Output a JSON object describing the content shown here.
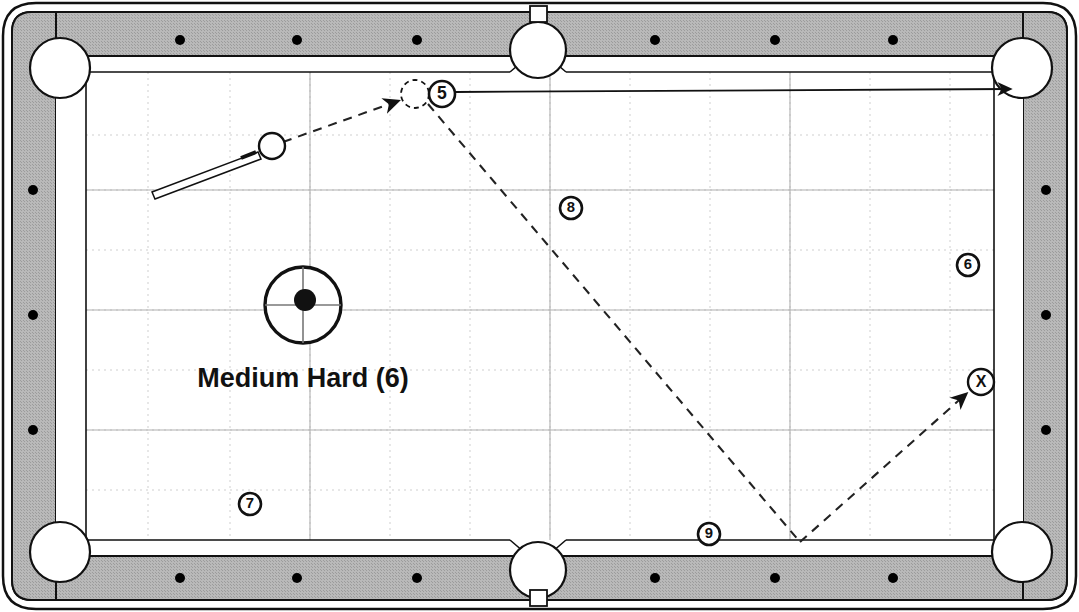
{
  "diagram": {
    "type": "pool-table-shot-diagram",
    "table": {
      "surface_color": "#ffffff",
      "rail_color": "#b5b5b5",
      "outline_color": "#000000",
      "grid_color": "#c9c9c9",
      "rail_dot_color": "#000000",
      "rail_dot_count": 18
    },
    "tip_indicator": {
      "label": "Medium Hard (6)",
      "speed_word": "Medium Hard",
      "speed_number": "6",
      "center_x": 303,
      "center_y": 305,
      "radius": 38,
      "tip_offset_x": 305,
      "tip_offset_y": 300,
      "tip_radius": 11
    },
    "cue_ball": {
      "label": "cue ball",
      "x": 272,
      "y": 146,
      "radius": 13
    },
    "ghost_ball": {
      "label": "ghost ball",
      "x": 415,
      "y": 94,
      "radius": 14
    },
    "cue_stick": {
      "tip_x": 258,
      "tip_y": 152,
      "butt_x": 152,
      "butt_y": 192
    },
    "balls": [
      {
        "number": "5",
        "x": 442,
        "y": 94,
        "radius": 13
      },
      {
        "number": "8",
        "x": 571,
        "y": 208,
        "radius": 11
      },
      {
        "number": "6",
        "x": 968,
        "y": 265,
        "radius": 11
      },
      {
        "number": "7",
        "x": 250,
        "y": 504,
        "radius": 11
      },
      {
        "number": "9",
        "x": 709,
        "y": 534,
        "radius": 11
      }
    ],
    "target_marker": {
      "number": "X",
      "x": 981,
      "y": 382,
      "radius": 13
    },
    "object_ball_path": {
      "style": "solid",
      "label": "object ball to top-right pocket",
      "points": "455,92 1010,89",
      "arrow_at": "1010,89"
    },
    "cue_ball_path": {
      "style": "dashed",
      "label": "cue ball path with bottom-rail bank",
      "segments": [
        {
          "from": "283,142",
          "to": "402,100",
          "arrow": true
        },
        {
          "from": "428,104",
          "to": "800,542",
          "arrow": false
        },
        {
          "from": "800,542",
          "to": "968,392",
          "arrow": true
        }
      ]
    },
    "pockets": [
      {
        "name": "top-left",
        "x": 60,
        "y": 68,
        "radius": 30
      },
      {
        "name": "top-middle",
        "x": 538,
        "y": 50,
        "radius": 28
      },
      {
        "name": "top-right",
        "x": 1022,
        "y": 68,
        "radius": 30
      },
      {
        "name": "bottom-left",
        "x": 60,
        "y": 552,
        "radius": 30
      },
      {
        "name": "bottom-middle",
        "x": 538,
        "y": 570,
        "radius": 28
      },
      {
        "name": "bottom-right",
        "x": 1022,
        "y": 552,
        "radius": 30
      }
    ],
    "rail_dots_top": [
      180,
      297,
      417,
      655,
      775,
      893
    ],
    "rail_dots_bottom": [
      180,
      297,
      417,
      655,
      775,
      893
    ],
    "rail_dots_left": [
      190,
      315,
      430
    ],
    "rail_dots_right": [
      190,
      315,
      430
    ],
    "grid_vertical_x": [
      148,
      230,
      310,
      390,
      470,
      550,
      630,
      710,
      790,
      870,
      950
    ],
    "grid_horizontal_y": [
      135,
      190,
      250,
      310,
      370,
      430,
      490
    ],
    "grid_major_x": [
      310,
      550,
      790
    ],
    "grid_major_y": [
      190,
      310,
      430
    ]
  }
}
